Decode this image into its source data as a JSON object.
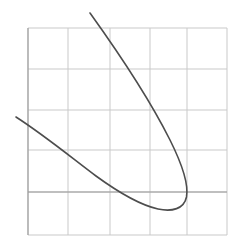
{
  "figure": {
    "width": 248,
    "height": 251,
    "background": "#ffffff",
    "title": "",
    "subtitle": ""
  },
  "grid": {
    "visible": true,
    "color": "#c9c9c9",
    "major_color": "#b0b0b0",
    "line_width": 1,
    "x_lines": [
      28,
      68,
      110,
      150,
      187,
      227
    ],
    "y_lines": [
      28,
      69,
      110,
      150,
      192,
      235
    ],
    "spacing_px": 41,
    "plot_left": 28,
    "plot_right": 227,
    "plot_top": 28,
    "plot_bottom": 235
  },
  "axes": {
    "x_axis_y": 192,
    "y_axis_x": 28,
    "x_axis_color": "#9a9a9a",
    "y_axis_color": "#9a9a9a",
    "xlabel": "",
    "ylabel": "",
    "xticklabels": [],
    "yticklabels": [],
    "xlim": [
      -1,
      4
    ],
    "ylim": [
      -1,
      4
    ]
  },
  "curve": {
    "name": "sideways-parabola",
    "color": "#4d4d4d",
    "line_width": 1.6,
    "fill": "none",
    "path": "M 90 13 C 118 52, 150 100, 170 140 C 182 164, 189 183, 186.5 197 C 184 209, 172 212, 158 209 C 140 205, 118 192, 96 176 C 72 158, 44 135, 16 117",
    "start_point": [
      90,
      13
    ],
    "vertex_point": [
      187,
      200
    ],
    "lowest_point": [
      160,
      211
    ],
    "end_point": [
      16,
      117
    ]
  },
  "legend": {
    "visible": false,
    "entries": []
  },
  "chart_data": {
    "type": "line",
    "title": "",
    "xlabel": "",
    "ylabel": "",
    "xlim": [
      -1,
      4
    ],
    "ylim": [
      -1,
      4
    ],
    "grid": true,
    "legend_position": "none",
    "xticklabels": [],
    "yticklabels": [],
    "series": [
      {
        "name": "curve",
        "color": "#4d4d4d",
        "comment": "rotated parabola; coordinates given in pixel space of the 248x251 figure",
        "x": [
          90,
          100,
          112,
          124,
          136,
          148,
          158,
          167,
          175,
          181,
          185,
          187,
          186,
          182,
          176,
          168,
          159,
          148,
          136,
          124,
          112,
          100,
          88,
          76,
          64,
          52,
          40,
          28,
          16
        ],
        "y": [
          13,
          27,
          44,
          61,
          79,
          98,
          114,
          130,
          146,
          162,
          178,
          194,
          203,
          208,
          211,
          211,
          209,
          205,
          200,
          194,
          187,
          180,
          172,
          163,
          153,
          143,
          132,
          124,
          117
        ]
      }
    ]
  }
}
